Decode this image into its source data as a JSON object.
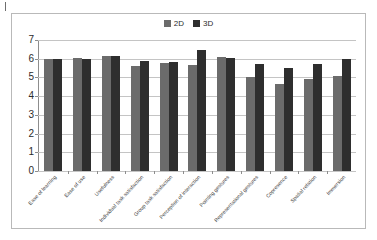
{
  "chart_data": {
    "type": "bar",
    "title": "",
    "subtitle": "",
    "xlabel": "",
    "ylabel": "",
    "ylim": [
      0,
      7
    ],
    "ytick_labels": [
      "7",
      "6",
      "5",
      "4",
      "3",
      "2",
      "1",
      "0"
    ],
    "ytick_values": [
      7,
      6,
      5,
      4,
      3,
      2,
      1,
      0
    ],
    "ystep": 1,
    "grid": true,
    "legend_position": "top-center",
    "categories": [
      "Ease of learning",
      "Ease of use",
      "Usefulness",
      "Individual task satisfaction",
      "Group task satisfaction",
      "Perception of interaction",
      "Pointing gestures",
      "Representational gestures",
      "Copresence",
      "Spatial relation",
      "Immersion"
    ],
    "series": [
      {
        "name": "2D",
        "color": "#6b6b6b",
        "values": [
          6.0,
          6.05,
          6.15,
          5.6,
          5.75,
          5.65,
          6.1,
          5.0,
          4.65,
          4.9,
          5.05
        ]
      },
      {
        "name": "3D",
        "color": "#2e2e2e",
        "values": [
          6.0,
          6.0,
          6.15,
          5.9,
          5.85,
          6.45,
          6.05,
          5.7,
          5.5,
          5.7,
          6.0
        ]
      }
    ]
  },
  "legend": {
    "entries": [
      {
        "label": "2D",
        "color": "#6b6b6b",
        "swatch_icon": "square-swatch-icon"
      },
      {
        "label": "3D",
        "color": "#2e2e2e",
        "swatch_icon": "square-swatch-icon"
      }
    ]
  },
  "colors": {
    "series_2d": "#6b6b6b",
    "series_3d": "#2e2e2e",
    "gridline": "#c4c4c4",
    "axis": "#8d8d8d",
    "frame_border": "#b9b9b9",
    "background": "#ffffff",
    "text": "#2b2b2b"
  }
}
